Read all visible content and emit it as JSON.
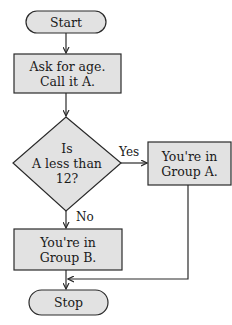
{
  "diagram": {
    "type": "flowchart",
    "colors": {
      "fill": "#e2e2e2",
      "stroke": "#2a2a2a",
      "background": "#ffffff"
    },
    "nodes": [
      {
        "id": "start",
        "shape": "terminator",
        "lines": [
          "Start"
        ]
      },
      {
        "id": "ask",
        "shape": "process",
        "lines": [
          "Ask for age.",
          "Call it A."
        ]
      },
      {
        "id": "decision",
        "shape": "decision",
        "lines": [
          "Is",
          "A less than",
          "12?"
        ]
      },
      {
        "id": "groupA",
        "shape": "process",
        "lines": [
          "You're in",
          "Group A."
        ]
      },
      {
        "id": "groupB",
        "shape": "process",
        "lines": [
          "You're in",
          "Group B."
        ]
      },
      {
        "id": "stop",
        "shape": "terminator",
        "lines": [
          "Stop"
        ]
      }
    ],
    "edges": [
      {
        "from": "start",
        "to": "ask",
        "label": ""
      },
      {
        "from": "ask",
        "to": "decision",
        "label": ""
      },
      {
        "from": "decision",
        "to": "groupA",
        "label": "Yes"
      },
      {
        "from": "decision",
        "to": "groupB",
        "label": "No"
      },
      {
        "from": "groupB",
        "to": "stop",
        "label": ""
      },
      {
        "from": "groupA",
        "to": "stop",
        "label": ""
      }
    ]
  }
}
